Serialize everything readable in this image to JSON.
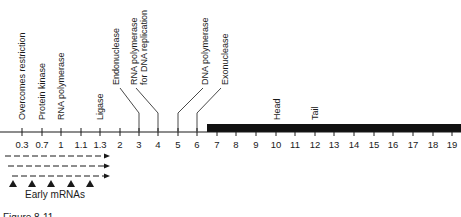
{
  "diagram": {
    "type": "genetic-map",
    "axis": {
      "y": 132,
      "x_start": 0,
      "x_end": 461,
      "color": "#1a1a1a"
    },
    "ticks": [
      {
        "label": "0.3",
        "x": 22
      },
      {
        "label": "0.7",
        "x": 42
      },
      {
        "label": "1",
        "x": 61
      },
      {
        "label": "1.1",
        "x": 81
      },
      {
        "label": "1.3",
        "x": 100
      },
      {
        "label": "2",
        "x": 120
      },
      {
        "label": "3",
        "x": 139
      },
      {
        "label": "4",
        "x": 158
      },
      {
        "label": "5",
        "x": 178
      },
      {
        "label": "6",
        "x": 197
      },
      {
        "label": "7",
        "x": 217
      },
      {
        "label": "8",
        "x": 236
      },
      {
        "label": "9",
        "x": 256
      },
      {
        "label": "10",
        "x": 276
      },
      {
        "label": "11",
        "x": 295
      },
      {
        "label": "12",
        "x": 315
      },
      {
        "label": "13",
        "x": 334
      },
      {
        "label": "14",
        "x": 354
      },
      {
        "label": "15",
        "x": 374
      },
      {
        "label": "16",
        "x": 393
      },
      {
        "label": "17",
        "x": 413
      },
      {
        "label": "18",
        "x": 433
      },
      {
        "label": "19",
        "x": 452
      }
    ],
    "late_region_bar": {
      "x_start": 207,
      "x_end": 461,
      "y_top": 124,
      "y_bottom": 132,
      "color": "#111111"
    },
    "gene_labels": [
      {
        "lines": [
          "Overcomes restriction"
        ],
        "x": 25,
        "y_bottom": 120,
        "leader": null
      },
      {
        "lines": [
          "Protein kinase"
        ],
        "x": 45,
        "y_bottom": 120,
        "leader": null
      },
      {
        "lines": [
          "RNA polymerase"
        ],
        "x": 64,
        "y_bottom": 120,
        "leader": null
      },
      {
        "lines": [
          "Ligase"
        ],
        "x": 103,
        "y_bottom": 120,
        "leader": null
      },
      {
        "lines": [
          "Endonuclease"
        ],
        "x": 119,
        "y_bottom": 85,
        "leader": {
          "from": [
            120,
            88
          ],
          "bend": [
            139,
            113
          ],
          "to": [
            139,
            131
          ]
        }
      },
      {
        "lines": [
          "RNA polymerase",
          "for DNA replication"
        ],
        "x": 137,
        "y_bottom": 85,
        "leader": {
          "from": [
            136,
            88
          ],
          "bend": [
            158,
            113
          ],
          "to": [
            158,
            131
          ]
        }
      },
      {
        "lines": [
          "DNA polymerase"
        ],
        "x": 208,
        "y_bottom": 85,
        "leader": {
          "from": [
            203,
            88
          ],
          "bend": [
            178,
            113
          ],
          "to": [
            178,
            131
          ]
        }
      },
      {
        "lines": [
          "Exonuclease"
        ],
        "x": 228,
        "y_bottom": 85,
        "leader": {
          "from": [
            221,
            88
          ],
          "bend": [
            197,
            113
          ],
          "to": [
            197,
            131
          ]
        }
      },
      {
        "lines": [
          "Head"
        ],
        "x": 280,
        "y_bottom": 120,
        "leader": null
      },
      {
        "lines": [
          "Tail"
        ],
        "x": 318,
        "y_bottom": 120,
        "leader": null
      }
    ],
    "transcripts": [
      {
        "x_start": 5,
        "x_end": 110,
        "y": 156
      },
      {
        "x_start": 8,
        "x_end": 110,
        "y": 166
      },
      {
        "x_start": 12,
        "x_end": 110,
        "y": 176
      }
    ],
    "promoters": [
      {
        "x": 13,
        "y": 184
      },
      {
        "x": 32,
        "y": 184
      },
      {
        "x": 51,
        "y": 184
      },
      {
        "x": 71,
        "y": 184
      },
      {
        "x": 90,
        "y": 184
      }
    ],
    "legend": {
      "label": "Early mRNAs",
      "x": 25,
      "y": 198
    },
    "caption": {
      "text": "Figure 8-11",
      "x": 3,
      "y": 221
    }
  }
}
